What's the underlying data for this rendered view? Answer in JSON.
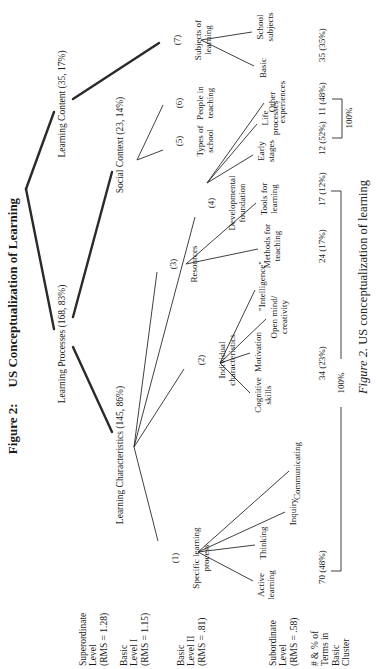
{
  "figure": {
    "title_prefix": "Figure 2:",
    "title": "US Conceptualization of Learning",
    "caption_prefix": "Figure 2.",
    "caption": "US conceptualization of learning"
  },
  "row_labels": [
    {
      "label": "Superordinate\nLevel\n(RMS = 1.28)"
    },
    {
      "label": "Basic\nLevel I\n(RMS = 1.15)"
    },
    {
      "label": "Basic\nLevel II\n(RMS = .81)"
    },
    {
      "label": "Subordinate\nLevel\n(RMS = .58)"
    },
    {
      "label": "# & % of\nTerms in\nBasic\nCluster"
    }
  ],
  "tree": {
    "superordinate": [
      {
        "label": "Learning Processes (168, 83%)"
      },
      {
        "label": "Learning Content (35, 17%)"
      }
    ],
    "basic_level_1": [
      {
        "label": "Learning Characteristics (145, 86%)"
      },
      {
        "label": "Social Context (23, 14%)"
      }
    ],
    "basic_level_2": [
      {
        "num": "(1)",
        "label": "Specific learning\nprocess"
      },
      {
        "num": "(2)",
        "label": "Individual\ncharacteristics"
      },
      {
        "num": "(3)",
        "label": "Resources"
      },
      {
        "num": "(4)",
        "label": "Developmental\nfoundation"
      },
      {
        "num": "(5)",
        "label": "Types of\nschool"
      },
      {
        "num": "(6)",
        "label": "People in\nteaching"
      },
      {
        "num": "(7)",
        "label": "Subjects of\nlearning"
      }
    ],
    "subordinate": [
      {
        "label": "Active\nlearning"
      },
      {
        "label": "Thinking"
      },
      {
        "label": "Inquiry"
      },
      {
        "label": "Communicating"
      },
      {
        "label": "Cognitive\nskills"
      },
      {
        "label": "Motivation"
      },
      {
        "label": "Open mind/\ncreativity"
      },
      {
        "label": "\"Intelligence\""
      },
      {
        "label": "Methods for\nteaching"
      },
      {
        "label": "Tools for\nlearning"
      },
      {
        "label": "Early\nstages"
      },
      {
        "label": "Life\nprocesses"
      },
      {
        "label": "Other\nexperiences"
      },
      {
        "label": "Basic"
      },
      {
        "label": "School\nsubjects"
      }
    ],
    "counts": [
      "70 (48%)",
      "34 (23%)",
      "24 (17%)",
      "17 (12%)",
      "12 (52%)",
      "11 (48%)",
      "35 (35%)"
    ],
    "bracket_labels": [
      "100%",
      "100%"
    ]
  }
}
